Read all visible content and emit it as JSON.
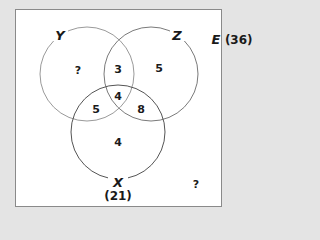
{
  "diagram": {
    "type": "venn",
    "universe": {
      "label": "E",
      "count": "(36)"
    },
    "sets": [
      {
        "name": "Y",
        "label": "Y",
        "stroke": "#9a9a9a"
      },
      {
        "name": "Z",
        "label": "Z",
        "stroke": "#7a7a7a"
      },
      {
        "name": "X",
        "label": "X",
        "total": "(21)",
        "stroke": "#555555"
      }
    ],
    "regions": {
      "y_only": "?",
      "y_and_z_only": "3",
      "z_only": "5",
      "x_y_z": "4",
      "x_and_y_only": "5",
      "x_and_z_only": "8",
      "x_only": "4",
      "outside": "?"
    }
  }
}
